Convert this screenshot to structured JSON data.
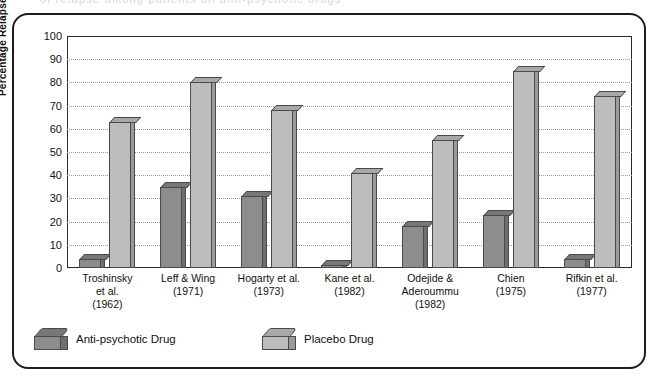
{
  "figure": {
    "scan_artifact_text": "of relapse among patients on anti-psychotic drugs",
    "border_color": "#1c1c1c",
    "background": "#ffffff"
  },
  "chart_data": {
    "type": "bar",
    "title": "",
    "xlabel": "",
    "ylabel": "Percentage Relapse",
    "ylim": [
      0,
      100
    ],
    "ytick_step": 10,
    "yticks": [
      100,
      90,
      80,
      70,
      60,
      50,
      40,
      30,
      20,
      10,
      0
    ],
    "grid": true,
    "grid_style": "dotted",
    "legend_position": "below-axis-left",
    "categories": [
      "Troshinsky\net al.\n(1962)",
      "Leff & Wing\n(1971)",
      "Hogarty et al.\n(1973)",
      "Kane et al.\n(1982)",
      "Odejide &\nAderoummu\n(1982)",
      "Chien\n(1975)",
      "Rifkin et al.\n(1977)"
    ],
    "series": [
      {
        "name": "Anti-psychotic Drug",
        "color": "#8d8d8d",
        "values": [
          4,
          35,
          31,
          1,
          18,
          23,
          4
        ]
      },
      {
        "name": "Placebo Drug",
        "color": "#bdbdbd",
        "values": [
          63,
          80,
          68,
          41,
          55,
          85,
          74
        ]
      }
    ]
  },
  "axis": {
    "y_title": "Percentage Relapse"
  },
  "legend": {
    "items": [
      {
        "label": "Anti-psychotic Drug"
      },
      {
        "label": "Placebo Drug"
      }
    ]
  }
}
